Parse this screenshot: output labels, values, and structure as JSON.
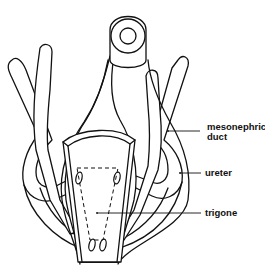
{
  "diagram": {
    "line_color": "#111111",
    "background": "#ffffff",
    "labels": [
      {
        "id": "mesonephric-duct",
        "lines": [
          "mesonephric",
          "duct"
        ]
      },
      {
        "id": "ureter",
        "lines": [
          "ureter"
        ]
      },
      {
        "id": "trigone",
        "lines": [
          "trigone"
        ]
      }
    ]
  }
}
